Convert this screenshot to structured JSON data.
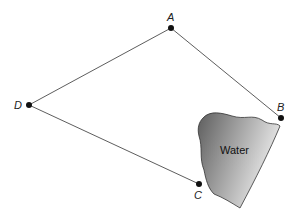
{
  "diagram": {
    "points": [
      {
        "id": "A",
        "label": "A",
        "x": 171,
        "y": 28
      },
      {
        "id": "B",
        "label": "B",
        "x": 281,
        "y": 118
      },
      {
        "id": "C",
        "label": "C",
        "x": 199,
        "y": 184
      },
      {
        "id": "D",
        "label": "D",
        "x": 29,
        "y": 105
      }
    ],
    "segments": [
      [
        "D",
        "A"
      ],
      [
        "A",
        "B"
      ],
      [
        "D",
        "C"
      ]
    ],
    "region": {
      "label": "Water",
      "fill_dark": "#6a6a6a",
      "fill_light": "#e4e4e4"
    }
  }
}
